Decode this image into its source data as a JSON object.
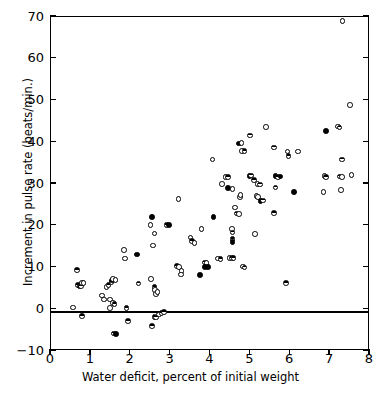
{
  "figure": {
    "caption_sliver": "",
    "background": "#ffffff",
    "ink": "#000000"
  },
  "chart_data": {
    "type": "scatter",
    "title": "",
    "xlabel": "Water deficit, percent of initial weight",
    "ylabel": "Increment in pulse rate (beats/min.)",
    "xlim": [
      0,
      8
    ],
    "ylim": [
      -10,
      70
    ],
    "xticks": [
      0,
      1,
      2,
      3,
      4,
      5,
      6,
      7,
      8
    ],
    "yticks": [
      -10,
      0,
      10,
      20,
      30,
      40,
      50,
      60,
      70
    ],
    "xticklabels": [
      "0",
      "1",
      "2",
      "3",
      "4",
      "5",
      "6",
      "7",
      "8"
    ],
    "yticklabels": [
      "−10",
      "0",
      "10",
      "20",
      "30",
      "40",
      "50",
      "60",
      "70"
    ],
    "grid": false,
    "legend": false,
    "reference_lines": [
      {
        "axis": "y",
        "value": 0
      }
    ],
    "marker_styles": [
      "open",
      "filled",
      "half"
    ],
    "points": [
      {
        "x": 0.58,
        "y": 0.2,
        "m": "open"
      },
      {
        "x": 0.67,
        "y": 9.1,
        "m": "half"
      },
      {
        "x": 0.7,
        "y": 5.6,
        "m": "half"
      },
      {
        "x": 0.74,
        "y": 5.2,
        "m": "filled"
      },
      {
        "x": 0.78,
        "y": 5.3,
        "m": "half"
      },
      {
        "x": 0.8,
        "y": 6.1,
        "m": "open"
      },
      {
        "x": 0.84,
        "y": 6.1,
        "m": "open"
      },
      {
        "x": 0.8,
        "y": -1.8,
        "m": "half"
      },
      {
        "x": 1.3,
        "y": 3.1,
        "m": "open"
      },
      {
        "x": 1.36,
        "y": 2.1,
        "m": "open"
      },
      {
        "x": 1.42,
        "y": 5.1,
        "m": "open"
      },
      {
        "x": 1.47,
        "y": 5.6,
        "m": "half"
      },
      {
        "x": 1.5,
        "y": 2.1,
        "m": "open"
      },
      {
        "x": 1.54,
        "y": 6.3,
        "m": "half"
      },
      {
        "x": 1.56,
        "y": 6.6,
        "m": "filled"
      },
      {
        "x": 1.58,
        "y": 7.0,
        "m": "open"
      },
      {
        "x": 1.64,
        "y": 6.7,
        "m": "open"
      },
      {
        "x": 1.5,
        "y": 0.1,
        "m": "open"
      },
      {
        "x": 1.58,
        "y": 1.3,
        "m": "open"
      },
      {
        "x": 1.62,
        "y": 1.0,
        "m": "half"
      },
      {
        "x": 1.6,
        "y": -6.0,
        "m": "half"
      },
      {
        "x": 1.66,
        "y": -6.1,
        "m": "filled"
      },
      {
        "x": 1.86,
        "y": 14.0,
        "m": "open"
      },
      {
        "x": 1.88,
        "y": 11.9,
        "m": "open"
      },
      {
        "x": 1.92,
        "y": 0.0,
        "m": "half"
      },
      {
        "x": 1.95,
        "y": -3.0,
        "m": "half"
      },
      {
        "x": 2.18,
        "y": 12.9,
        "m": "filled"
      },
      {
        "x": 2.22,
        "y": 5.9,
        "m": "half"
      },
      {
        "x": 2.52,
        "y": 20.0,
        "m": "open"
      },
      {
        "x": 2.56,
        "y": 21.8,
        "m": "filled"
      },
      {
        "x": 2.58,
        "y": 15.0,
        "m": "open"
      },
      {
        "x": 2.62,
        "y": 17.9,
        "m": "open"
      },
      {
        "x": 2.54,
        "y": 7.0,
        "m": "open"
      },
      {
        "x": 2.62,
        "y": 5.1,
        "m": "half"
      },
      {
        "x": 2.64,
        "y": 4.4,
        "m": "open"
      },
      {
        "x": 2.66,
        "y": 3.4,
        "m": "open"
      },
      {
        "x": 2.7,
        "y": 3.9,
        "m": "open"
      },
      {
        "x": 2.56,
        "y": -4.2,
        "m": "half"
      },
      {
        "x": 2.62,
        "y": -2.1,
        "m": "half"
      },
      {
        "x": 2.66,
        "y": -2.2,
        "m": "half"
      },
      {
        "x": 2.74,
        "y": -1.5,
        "m": "open"
      },
      {
        "x": 2.8,
        "y": -1.1,
        "m": "half"
      },
      {
        "x": 2.86,
        "y": -0.9,
        "m": "half"
      },
      {
        "x": 2.92,
        "y": 19.9,
        "m": "half"
      },
      {
        "x": 2.98,
        "y": 19.9,
        "m": "filled"
      },
      {
        "x": 3.22,
        "y": 26.1,
        "m": "open"
      },
      {
        "x": 3.18,
        "y": 10.1,
        "m": "half"
      },
      {
        "x": 3.24,
        "y": 9.9,
        "m": "open"
      },
      {
        "x": 3.3,
        "y": 8.9,
        "m": "open"
      },
      {
        "x": 3.28,
        "y": 8.1,
        "m": "open"
      },
      {
        "x": 3.52,
        "y": 16.9,
        "m": "open"
      },
      {
        "x": 3.56,
        "y": 16.1,
        "m": "half"
      },
      {
        "x": 3.62,
        "y": 15.6,
        "m": "open"
      },
      {
        "x": 3.8,
        "y": 19.0,
        "m": "open"
      },
      {
        "x": 3.76,
        "y": 8.0,
        "m": "filled"
      },
      {
        "x": 3.88,
        "y": 11.0,
        "m": "half"
      },
      {
        "x": 3.92,
        "y": 10.9,
        "m": "open"
      },
      {
        "x": 3.88,
        "y": 9.9,
        "m": "filled"
      },
      {
        "x": 3.96,
        "y": 9.9,
        "m": "filled"
      },
      {
        "x": 4.08,
        "y": 35.6,
        "m": "open"
      },
      {
        "x": 4.1,
        "y": 21.8,
        "m": "filled"
      },
      {
        "x": 4.22,
        "y": 11.9,
        "m": "open"
      },
      {
        "x": 4.28,
        "y": 11.8,
        "m": "half"
      },
      {
        "x": 4.32,
        "y": 29.7,
        "m": "open"
      },
      {
        "x": 4.4,
        "y": 31.5,
        "m": "open"
      },
      {
        "x": 4.46,
        "y": 31.4,
        "m": "half"
      },
      {
        "x": 4.46,
        "y": 28.8,
        "m": "filled"
      },
      {
        "x": 4.58,
        "y": 28.6,
        "m": "open"
      },
      {
        "x": 4.5,
        "y": 12.1,
        "m": "open"
      },
      {
        "x": 4.56,
        "y": 12.0,
        "m": "half"
      },
      {
        "x": 4.6,
        "y": 12.0,
        "m": "half"
      },
      {
        "x": 4.56,
        "y": 19.0,
        "m": "open"
      },
      {
        "x": 4.58,
        "y": 18.1,
        "m": "half"
      },
      {
        "x": 4.58,
        "y": 16.6,
        "m": "half"
      },
      {
        "x": 4.58,
        "y": 15.9,
        "m": "filled"
      },
      {
        "x": 4.64,
        "y": 24.1,
        "m": "open"
      },
      {
        "x": 4.68,
        "y": 22.7,
        "m": "half"
      },
      {
        "x": 4.74,
        "y": 22.6,
        "m": "open"
      },
      {
        "x": 4.76,
        "y": 26.6,
        "m": "open"
      },
      {
        "x": 4.78,
        "y": 27.1,
        "m": "open"
      },
      {
        "x": 4.74,
        "y": 39.5,
        "m": "filled"
      },
      {
        "x": 4.8,
        "y": 39.6,
        "m": "open"
      },
      {
        "x": 4.82,
        "y": 37.7,
        "m": "open"
      },
      {
        "x": 4.88,
        "y": 37.6,
        "m": "half"
      },
      {
        "x": 4.84,
        "y": 10.0,
        "m": "open"
      },
      {
        "x": 4.88,
        "y": 9.8,
        "m": "half"
      },
      {
        "x": 5.02,
        "y": 41.4,
        "m": "half"
      },
      {
        "x": 5.0,
        "y": 31.7,
        "m": "filled"
      },
      {
        "x": 5.04,
        "y": 31.8,
        "m": "half"
      },
      {
        "x": 5.12,
        "y": 30.7,
        "m": "half"
      },
      {
        "x": 5.2,
        "y": 29.8,
        "m": "open"
      },
      {
        "x": 5.26,
        "y": 29.6,
        "m": "half"
      },
      {
        "x": 5.14,
        "y": 17.8,
        "m": "open"
      },
      {
        "x": 5.18,
        "y": 26.9,
        "m": "open"
      },
      {
        "x": 5.22,
        "y": 26.6,
        "m": "open"
      },
      {
        "x": 5.28,
        "y": 25.7,
        "m": "filled"
      },
      {
        "x": 5.34,
        "y": 25.8,
        "m": "half"
      },
      {
        "x": 5.42,
        "y": 43.4,
        "m": "open"
      },
      {
        "x": 5.62,
        "y": 38.5,
        "m": "half"
      },
      {
        "x": 5.66,
        "y": 31.7,
        "m": "filled"
      },
      {
        "x": 5.72,
        "y": 31.5,
        "m": "half"
      },
      {
        "x": 5.78,
        "y": 31.6,
        "m": "filled"
      },
      {
        "x": 5.66,
        "y": 28.9,
        "m": "half"
      },
      {
        "x": 5.62,
        "y": 22.8,
        "m": "half"
      },
      {
        "x": 5.92,
        "y": 6.1,
        "m": "half"
      },
      {
        "x": 5.98,
        "y": 36.4,
        "m": "half"
      },
      {
        "x": 5.96,
        "y": 37.5,
        "m": "open"
      },
      {
        "x": 6.12,
        "y": 27.8,
        "m": "filled"
      },
      {
        "x": 6.22,
        "y": 37.5,
        "m": "open"
      },
      {
        "x": 6.88,
        "y": 31.7,
        "m": "open"
      },
      {
        "x": 6.92,
        "y": 31.4,
        "m": "half"
      },
      {
        "x": 6.86,
        "y": 27.9,
        "m": "open"
      },
      {
        "x": 6.92,
        "y": 42.4,
        "m": "filled"
      },
      {
        "x": 7.22,
        "y": 43.5,
        "m": "open"
      },
      {
        "x": 7.26,
        "y": 43.3,
        "m": "half"
      },
      {
        "x": 7.26,
        "y": 31.6,
        "m": "half"
      },
      {
        "x": 7.32,
        "y": 31.5,
        "m": "open"
      },
      {
        "x": 7.3,
        "y": 28.3,
        "m": "open"
      },
      {
        "x": 7.32,
        "y": 35.6,
        "m": "half"
      },
      {
        "x": 7.34,
        "y": 68.8,
        "m": "open"
      },
      {
        "x": 7.52,
        "y": 48.7,
        "m": "open"
      },
      {
        "x": 7.56,
        "y": 31.9,
        "m": "open"
      }
    ]
  }
}
